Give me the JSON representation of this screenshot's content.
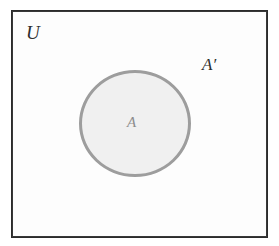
{
  "figure": {
    "kind": "venn-diagram",
    "width": 279,
    "height": 246,
    "background_color": "#ffffff"
  },
  "universe": {
    "label": "U",
    "border_color": "#2b2b2b",
    "fill_color": "#fdfdfd"
  },
  "set_a": {
    "label": "A",
    "fill_color": "#f0f0f0",
    "stroke_color": "#9d9d9d",
    "label_color": "#8d8d8d"
  },
  "complement": {
    "label": "A′",
    "label_color": "#2e2e2e"
  }
}
